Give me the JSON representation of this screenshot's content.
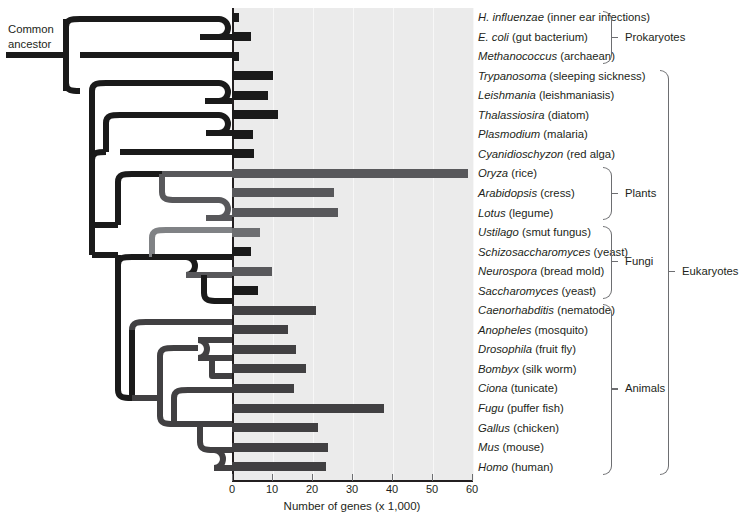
{
  "figure": {
    "ancestor_label_line1": "Common",
    "ancestor_label_line2": "ancestor"
  },
  "chart_data": {
    "type": "bar",
    "title": "",
    "xlabel": "Number of genes (x 1,000)",
    "ylabel": "",
    "xlim": [
      0,
      60
    ],
    "xticks": [
      0,
      10,
      20,
      30,
      40,
      50,
      60
    ],
    "grid": false,
    "orientation": "horizontal",
    "categories": [
      "H. influenzae",
      "E. coli",
      "Methanococcus",
      "Trypanosoma",
      "Leishmania",
      "Thalassiosira",
      "Plasmodium",
      "Cyanidioschyzon",
      "Oryza",
      "Arabidopsis",
      "Lotus",
      "Ustilago",
      "Schizosaccharomyces",
      "Neurospora",
      "Saccharomyces",
      "Caenorhabditis",
      "Anopheles",
      "Drosophila",
      "Bombyx",
      "Ciona",
      "Fugu",
      "Gallus",
      "Mus",
      "Homo"
    ],
    "values": [
      1.7,
      4.8,
      1.7,
      10.3,
      9.1,
      11.5,
      5.3,
      5.6,
      59.0,
      25.5,
      26.5,
      6.9,
      4.8,
      9.9,
      6.4,
      21.0,
      14.0,
      16.0,
      18.5,
      15.5,
      38.0,
      21.5,
      24.0,
      23.5
    ],
    "bar_colors": [
      "#1a1a1a",
      "#1a1a1a",
      "#1a1a1a",
      "#1a1a1a",
      "#1a1a1a",
      "#1a1a1a",
      "#1a1a1a",
      "#1a1a1a",
      "#58585b",
      "#58585b",
      "#58585b",
      "#6d6e71",
      "#1a1a1a",
      "#58585b",
      "#1a1a1a",
      "#414042",
      "#414042",
      "#414042",
      "#414042",
      "#414042",
      "#414042",
      "#414042",
      "#414042",
      "#414042"
    ]
  },
  "taxa": [
    {
      "genus": "H. influenzae",
      "common": "(inner ear infections)"
    },
    {
      "genus": "E. coli",
      "common": "(gut bacterium)"
    },
    {
      "genus": "Methanococcus",
      "common": "(archaean)"
    },
    {
      "genus": "Trypanosoma",
      "common": "(sleeping sickness)"
    },
    {
      "genus": "Leishmania",
      "common": "(leishmaniasis)"
    },
    {
      "genus": "Thalassiosira",
      "common": "(diatom)"
    },
    {
      "genus": "Plasmodium",
      "common": "(malaria)"
    },
    {
      "genus": "Cyanidioschyzon",
      "common": "(red alga)"
    },
    {
      "genus": "Oryza",
      "common": "(rice)"
    },
    {
      "genus": "Arabidopsis",
      "common": "(cress)"
    },
    {
      "genus": "Lotus",
      "common": "(legume)"
    },
    {
      "genus": "Ustilago",
      "common": "(smut fungus)"
    },
    {
      "genus": "Schizosaccharomyces",
      "common": "(yeast)"
    },
    {
      "genus": "Neurospora",
      "common": "(bread mold)"
    },
    {
      "genus": "Saccharomyces",
      "common": "(yeast)"
    },
    {
      "genus": "Caenorhabditis",
      "common": "(nematode)"
    },
    {
      "genus": "Anopheles",
      "common": "(mosquito)"
    },
    {
      "genus": "Drosophila",
      "common": "(fruit fly)"
    },
    {
      "genus": "Bombyx",
      "common": "(silk worm)"
    },
    {
      "genus": "Ciona",
      "common": "(tunicate)"
    },
    {
      "genus": "Fugu",
      "common": "(puffer fish)"
    },
    {
      "genus": "Gallus",
      "common": "(chicken)"
    },
    {
      "genus": "Mus",
      "common": "(mouse)"
    },
    {
      "genus": "Homo",
      "common": "(human)"
    }
  ],
  "groups": [
    {
      "label": "Prokaryotes",
      "first": 0,
      "last": 2,
      "x": 603,
      "label_x": 625
    },
    {
      "label": "Plants",
      "first": 8,
      "last": 10,
      "x": 603,
      "label_x": 625
    },
    {
      "label": "Fungi",
      "first": 11,
      "last": 14,
      "x": 603,
      "label_x": 625
    },
    {
      "label": "Animals",
      "first": 15,
      "last": 23,
      "x": 603,
      "label_x": 625
    },
    {
      "label": "Eukaryotes",
      "first": 3,
      "last": 23,
      "x": 660,
      "label_x": 682
    }
  ],
  "colors": {
    "plot_background": "#ebebeb",
    "axis": "#231f20",
    "tree_dark": "#1a1a1a",
    "tree_mid": "#58585b",
    "tree_light": "#808285",
    "text": "#231f20",
    "bracket": "#6d6e71"
  }
}
